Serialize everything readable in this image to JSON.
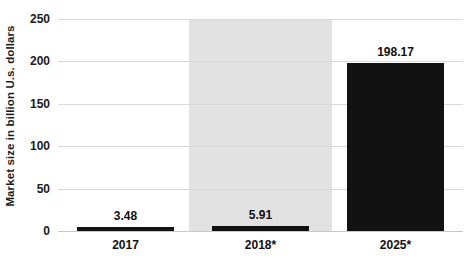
{
  "chart_data": {
    "type": "bar",
    "title": "",
    "subtitle": "",
    "xlabel": "",
    "ylabel": "Market size in billion U.s. dollars",
    "categories": [
      "2017",
      "2018*",
      "2025*"
    ],
    "values": [
      3.48,
      5.91,
      198.17
    ],
    "value_labels": [
      "3.48",
      "5.91",
      "198.17"
    ],
    "ylim": [
      0,
      250
    ],
    "yticks": [
      0,
      50,
      100,
      150,
      200,
      250
    ],
    "ytick_labels": [
      "0",
      "50",
      "100",
      "150",
      "200",
      "250"
    ],
    "grid": true,
    "legend": false,
    "legend_position": "none",
    "series": [
      {
        "name": "Market size",
        "values": [
          3.48,
          5.91,
          198.17
        ]
      }
    ],
    "annotations": [
      {
        "type": "highlight-band",
        "category": "2018*",
        "color": "#e2e2e2"
      }
    ],
    "colors": {
      "bar": "#121212",
      "grid": "#d9d9d9",
      "baseline": "#c8c8c8",
      "highlight": "#e2e2e2",
      "text": "#111111",
      "background": "#ffffff"
    }
  }
}
